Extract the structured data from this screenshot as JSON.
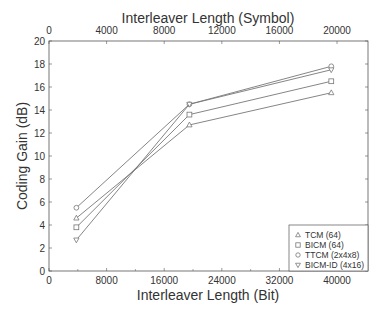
{
  "chart_data": {
    "type": "line",
    "title": "",
    "xlabel": "Interleaver Length (Bit)",
    "x2label": "Interleaver Length (Symbol)",
    "ylabel": "Coding Gain (dB)",
    "xlim": [
      0,
      44300
    ],
    "x2lim": [
      0,
      22150
    ],
    "ylim": [
      0,
      20
    ],
    "xticks": [
      0,
      8000,
      16000,
      24000,
      32000,
      40000
    ],
    "xtick_labels": [
      "0",
      "8000",
      "16000",
      "24000",
      "32000",
      "40000"
    ],
    "x2ticks": [
      0,
      4000,
      8000,
      12000,
      16000,
      20000
    ],
    "x2tick_labels": [
      "0",
      "4000",
      "8000",
      "12000",
      "16000",
      "20000"
    ],
    "yticks": [
      0,
      2,
      4,
      6,
      8,
      10,
      12,
      14,
      16,
      18,
      20
    ],
    "ytick_labels": [
      "0",
      "2",
      "4",
      "6",
      "8",
      "10",
      "12",
      "14",
      "16",
      "18",
      "20"
    ],
    "grid": false,
    "legend_position": "bottom-right",
    "x": [
      3800,
      19500,
      39200
    ],
    "series": [
      {
        "name": "TCM (64)",
        "marker": "triangle-up",
        "values": [
          4.6,
          12.7,
          15.5
        ]
      },
      {
        "name": "BICM (64)",
        "marker": "square",
        "values": [
          3.8,
          13.6,
          16.5
        ]
      },
      {
        "name": "TTCM (2x4x8)",
        "marker": "circle",
        "values": [
          5.5,
          14.5,
          17.8
        ]
      },
      {
        "name": "BICM-ID (4x16)",
        "marker": "triangle-down",
        "values": [
          2.7,
          14.5,
          17.5
        ]
      }
    ],
    "colors": {
      "line": "#777777",
      "axis": "#555555",
      "text": "#333333"
    }
  }
}
